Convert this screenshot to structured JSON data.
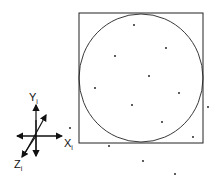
{
  "diagram": {
    "square": {
      "x": 79,
      "y": 13,
      "w": 124,
      "h": 130,
      "stroke": "#222222"
    },
    "circle": {
      "cx": 141,
      "cy": 78,
      "rx": 62,
      "ry": 64,
      "stroke": "#222222"
    },
    "points": [
      [
        134,
        25
      ],
      [
        166,
        48
      ],
      [
        115,
        56
      ],
      [
        149,
        76
      ],
      [
        95,
        88
      ],
      [
        179,
        93
      ],
      [
        132,
        105
      ],
      [
        208,
        107
      ],
      [
        162,
        122
      ],
      [
        70,
        128
      ],
      [
        193,
        137
      ],
      [
        109,
        146
      ],
      [
        143,
        161
      ],
      [
        175,
        174
      ]
    ],
    "axes": {
      "origin": [
        36,
        136
      ],
      "y_label": "Y",
      "y_sub": "i",
      "x_label": "X",
      "x_sub": "i",
      "z_label": "Z",
      "z_sub": "i"
    }
  }
}
